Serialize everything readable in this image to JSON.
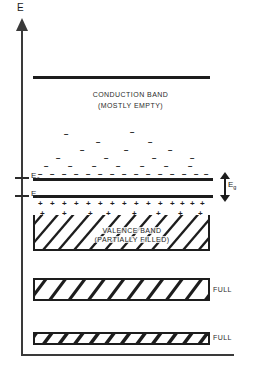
{
  "figure": {
    "type": "energy-band-diagram",
    "axis": {
      "y_label": "E",
      "y_label_name": "energy"
    },
    "band_edges": [
      {
        "id": "Ec",
        "label": "E",
        "subscript": "c",
        "y": 177,
        "name": "conduction-band-edge"
      },
      {
        "id": "Ev",
        "label": "E",
        "subscript": "v",
        "y": 196,
        "name": "valence-band-edge"
      }
    ],
    "gap": {
      "label": "E",
      "subscript": "g",
      "name": "band-gap",
      "annotation": "double-headed-arrow"
    },
    "bands": [
      {
        "name": "conduction-band",
        "title": "CONDUCTION BAND",
        "subtitle": "(MOSTLY EMPTY)",
        "fill_state": "mostly empty",
        "carrier": "electrons",
        "carrier_symbol": "−",
        "top_line_y": 76,
        "bottom_line_y": 180
      },
      {
        "name": "valence-band",
        "title": "VALENCE BAND",
        "subtitle": "(PARTIALLY FILLED)",
        "fill_state": "partially filled",
        "carrier": "holes",
        "carrier_symbol": "+",
        "top_line_y": 196,
        "bottom_line_y": 250
      },
      {
        "name": "full-band-upper",
        "title": "FULL",
        "fill_state": "full",
        "top_line_y": 278,
        "bottom_line_y": 300
      },
      {
        "name": "full-band-lower",
        "title": "FULL",
        "fill_state": "full",
        "top_line_y": 332,
        "bottom_line_y": 344
      }
    ],
    "labels": {
      "full_upper": "FULL",
      "full_lower": "FULL"
    },
    "electrons": [
      {
        "x": 38,
        "y": 171
      },
      {
        "x": 50,
        "y": 171
      },
      {
        "x": 62,
        "y": 171
      },
      {
        "x": 74,
        "y": 171
      },
      {
        "x": 86,
        "y": 171
      },
      {
        "x": 98,
        "y": 171
      },
      {
        "x": 110,
        "y": 171
      },
      {
        "x": 122,
        "y": 171
      },
      {
        "x": 134,
        "y": 171
      },
      {
        "x": 146,
        "y": 171
      },
      {
        "x": 158,
        "y": 171
      },
      {
        "x": 170,
        "y": 171
      },
      {
        "x": 182,
        "y": 171
      },
      {
        "x": 194,
        "y": 171
      },
      {
        "x": 204,
        "y": 171
      },
      {
        "x": 44,
        "y": 163
      },
      {
        "x": 68,
        "y": 163
      },
      {
        "x": 92,
        "y": 163
      },
      {
        "x": 116,
        "y": 163
      },
      {
        "x": 140,
        "y": 163
      },
      {
        "x": 164,
        "y": 163
      },
      {
        "x": 188,
        "y": 163
      },
      {
        "x": 56,
        "y": 155
      },
      {
        "x": 104,
        "y": 155
      },
      {
        "x": 152,
        "y": 155
      },
      {
        "x": 190,
        "y": 155
      },
      {
        "x": 80,
        "y": 147
      },
      {
        "x": 124,
        "y": 147
      },
      {
        "x": 168,
        "y": 147
      },
      {
        "x": 96,
        "y": 139
      },
      {
        "x": 148,
        "y": 139
      },
      {
        "x": 64,
        "y": 131
      },
      {
        "x": 130,
        "y": 129
      }
    ],
    "holes": [
      {
        "x": 38,
        "y": 200
      },
      {
        "x": 50,
        "y": 200
      },
      {
        "x": 62,
        "y": 200
      },
      {
        "x": 74,
        "y": 200
      },
      {
        "x": 86,
        "y": 200
      },
      {
        "x": 98,
        "y": 200
      },
      {
        "x": 110,
        "y": 200
      },
      {
        "x": 122,
        "y": 200
      },
      {
        "x": 134,
        "y": 200
      },
      {
        "x": 146,
        "y": 200
      },
      {
        "x": 158,
        "y": 200
      },
      {
        "x": 170,
        "y": 200
      },
      {
        "x": 180,
        "y": 200
      },
      {
        "x": 190,
        "y": 200
      },
      {
        "x": 200,
        "y": 200
      },
      {
        "x": 40,
        "y": 210
      },
      {
        "x": 62,
        "y": 210
      },
      {
        "x": 88,
        "y": 210
      },
      {
        "x": 106,
        "y": 210
      },
      {
        "x": 132,
        "y": 210
      },
      {
        "x": 156,
        "y": 210
      },
      {
        "x": 178,
        "y": 210
      },
      {
        "x": 198,
        "y": 210
      },
      {
        "x": 52,
        "y": 219
      },
      {
        "x": 84,
        "y": 220
      },
      {
        "x": 118,
        "y": 220
      },
      {
        "x": 146,
        "y": 222
      },
      {
        "x": 172,
        "y": 220
      },
      {
        "x": 72,
        "y": 228
      },
      {
        "x": 136,
        "y": 230
      }
    ]
  }
}
